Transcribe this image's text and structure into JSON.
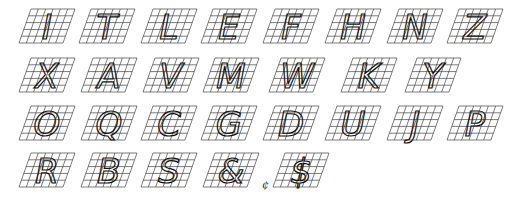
{
  "grid": {
    "cols": 6,
    "rows": 5,
    "tile_w": 44,
    "tile_h": 34,
    "skew": 12,
    "line_color": "#444444",
    "stroke_color": "#111111"
  },
  "rows": [
    {
      "y": 8,
      "items": [
        {
          "char": "I",
          "x": 18
        },
        {
          "char": "T",
          "x": 78
        },
        {
          "char": "L",
          "x": 140
        },
        {
          "char": "E",
          "x": 200
        },
        {
          "char": "F",
          "x": 262
        },
        {
          "char": "H",
          "x": 324
        },
        {
          "char": "N",
          "x": 386
        },
        {
          "char": "Z",
          "x": 446
        }
      ]
    },
    {
      "y": 57,
      "items": [
        {
          "char": "X",
          "x": 18
        },
        {
          "char": "A",
          "x": 80
        },
        {
          "char": "V",
          "x": 142
        },
        {
          "char": "M",
          "x": 202
        },
        {
          "char": "W",
          "x": 268
        },
        {
          "char": "K",
          "x": 340
        },
        {
          "char": "Y",
          "x": 404
        }
      ]
    },
    {
      "y": 105,
      "items": [
        {
          "char": "O",
          "x": 18
        },
        {
          "char": "Q",
          "x": 80
        },
        {
          "char": "C",
          "x": 140
        },
        {
          "char": "G",
          "x": 200
        },
        {
          "char": "D",
          "x": 262
        },
        {
          "char": "U",
          "x": 324
        },
        {
          "char": "J",
          "x": 386
        },
        {
          "char": "P",
          "x": 446
        }
      ]
    },
    {
      "y": 152,
      "items": [
        {
          "char": "R",
          "x": 18
        },
        {
          "char": "B",
          "x": 80
        },
        {
          "char": "S",
          "x": 140
        },
        {
          "char": "&",
          "x": 202
        },
        {
          "char": "$",
          "x": 272
        }
      ]
    }
  ],
  "extra_marks": [
    {
      "char": "¢",
      "x": 262,
      "y": 178
    }
  ]
}
